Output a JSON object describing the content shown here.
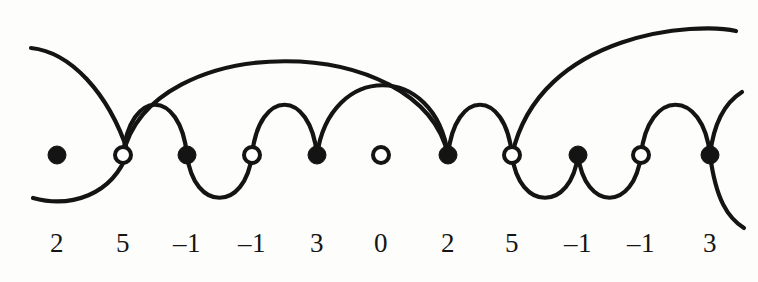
{
  "figure": {
    "background_color": "#fdfdfc",
    "stroke_color": "#141414",
    "label_color": "#151515",
    "node_radius_filled": 9,
    "node_radius_hollow": 8,
    "baseline_y": 155,
    "label_y": 228
  },
  "nodes": [
    {
      "index": 1,
      "value": "2",
      "type": "filled",
      "x": 57,
      "y": 155
    },
    {
      "index": 2,
      "value": "5",
      "type": "hollow",
      "x": 123,
      "y": 155
    },
    {
      "index": 3,
      "value": "–1",
      "type": "filled",
      "x": 187,
      "y": 155
    },
    {
      "index": 4,
      "value": "–1",
      "type": "hollow",
      "x": 252,
      "y": 155
    },
    {
      "index": 5,
      "value": "3",
      "type": "filled",
      "x": 317,
      "y": 155
    },
    {
      "index": 6,
      "value": "0",
      "type": "hollow",
      "x": 381,
      "y": 155
    },
    {
      "index": 7,
      "value": "2",
      "type": "filled",
      "x": 448,
      "y": 155
    },
    {
      "index": 8,
      "value": "5",
      "type": "hollow",
      "x": 512,
      "y": 155
    },
    {
      "index": 9,
      "value": "–1",
      "type": "filled",
      "x": 578,
      "y": 155
    },
    {
      "index": 10,
      "value": "–1",
      "type": "hollow",
      "x": 641,
      "y": 155
    },
    {
      "index": 11,
      "value": "3",
      "type": "filled",
      "x": 710,
      "y": 155
    }
  ],
  "sequence": [
    "2",
    "5",
    "–1",
    "–1",
    "3",
    "0",
    "2",
    "5",
    "–1",
    "–1",
    "3"
  ],
  "arcs": [
    {
      "id": "arc-open-left",
      "from": "left-edge",
      "to": "node-1",
      "side": "upper",
      "path": "M 31 48 C 70 52 108 92 128 152"
    },
    {
      "id": "arc-tail-left",
      "from": "node-1",
      "to": "left-edge-lower",
      "side": "lower",
      "path": "M 128 152 C 112 196 70 208 33 198"
    },
    {
      "id": "arc-2-to-7",
      "from": "node-2",
      "to": "node-7",
      "side": "upper",
      "path": "M 123 155 C 150 30 420 30 448 155"
    },
    {
      "id": "arc-2-to-3",
      "from": "node-2",
      "to": "node-3",
      "side": "upper",
      "path": "M 123 155 C 130 88 180 88 187 155"
    },
    {
      "id": "arc-3-to-4",
      "from": "node-3",
      "to": "node-4",
      "side": "lower",
      "path": "M 187 155 C 194 212 245 212 252 155"
    },
    {
      "id": "arc-4-to-5",
      "from": "node-4",
      "to": "node-5",
      "side": "upper",
      "path": "M 252 155 C 259 88 310 88 317 155"
    },
    {
      "id": "arc-5-to-7",
      "from": "node-5",
      "to": "node-7",
      "side": "upper",
      "path": "M 317 155 C 330 62 435 62 448 155"
    },
    {
      "id": "arc-8-to-right-edge",
      "from": "node-8",
      "to": "right-edge",
      "side": "upper",
      "path": "M 512 155 C 540 30 700 22 736 31"
    },
    {
      "id": "arc-7-to-8",
      "from": "node-7",
      "to": "node-8",
      "side": "upper",
      "path": "M 448 155 C 455 88 505 88 512 155"
    },
    {
      "id": "arc-8-to-9",
      "from": "node-8",
      "to": "node-9",
      "side": "lower",
      "path": "M 512 155 C 519 212 571 212 578 155"
    },
    {
      "id": "arc-9-to-10",
      "from": "node-9",
      "to": "node-10",
      "side": "lower",
      "path": "M 578 155 C 585 212 634 212 641 155"
    },
    {
      "id": "arc-10-to-11",
      "from": "node-10",
      "to": "node-11",
      "side": "upper",
      "path": "M 641 155 C 648 88 703 88 710 155"
    },
    {
      "id": "arc-open-right",
      "from": "node-11",
      "to": "right-edge-lower",
      "side": "lower",
      "path": "M 710 155 C 716 200 728 218 744 228"
    },
    {
      "id": "arc-open-right-up",
      "from": "node-11",
      "to": "upper-right-tail",
      "side": "upper",
      "path": "M 710 155 C 714 120 726 102 742 92"
    }
  ],
  "isolated_nodes": [
    6
  ]
}
